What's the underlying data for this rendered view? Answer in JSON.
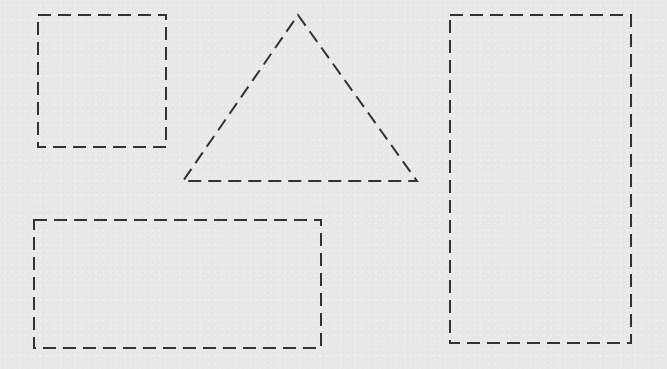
{
  "canvas": {
    "width": 667,
    "height": 369,
    "background": "#e9e9e9"
  },
  "style": {
    "stroke": "#333333",
    "dash": "13 7"
  },
  "shapes": [
    {
      "name": "small-square",
      "type": "rect",
      "x": 38,
      "y": 15,
      "width": 128,
      "height": 132
    },
    {
      "name": "triangle",
      "type": "polygon",
      "points": "298,15 417,181 183,181"
    },
    {
      "name": "tall-rectangle",
      "type": "rect",
      "x": 450,
      "y": 15,
      "width": 181,
      "height": 328
    },
    {
      "name": "wide-rectangle",
      "type": "rect",
      "x": 34,
      "y": 220,
      "width": 287,
      "height": 128
    }
  ]
}
